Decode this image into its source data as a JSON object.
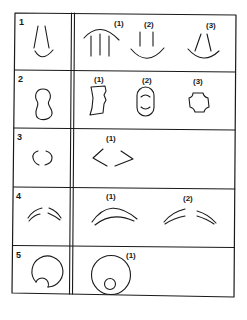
{
  "diagram": {
    "type": "shape-variant-table",
    "colors": {
      "stroke": "#1a1a1a",
      "background": "#ffffff"
    },
    "rows": [
      {
        "number": "1",
        "base_shape": "open-cone-with-bottom-arc",
        "variants": [
          {
            "label": "(1)",
            "shape": "arc-over-three-vertical-lines"
          },
          {
            "label": "(2)",
            "shape": "two-vertical-lines-over-bottom-arc"
          },
          {
            "label": "(3)",
            "shape": "splayed-lines-over-bottom-arc"
          }
        ]
      },
      {
        "number": "2",
        "base_shape": "peanut-outline",
        "variants": [
          {
            "label": "(1)",
            "shape": "irregular-quadrilateral"
          },
          {
            "label": "(2)",
            "shape": "rounded-capsule-with-inner-arcs"
          },
          {
            "label": "(3)",
            "shape": "cross-notched-square"
          }
        ]
      },
      {
        "number": "3",
        "base_shape": "broken-ellipse",
        "variants": [
          {
            "label": "(1)",
            "shape": "broken-diamond"
          }
        ]
      },
      {
        "number": "4",
        "base_shape": "split-double-arc",
        "variants": [
          {
            "label": "(1)",
            "shape": "continuous-double-arc"
          },
          {
            "label": "(2)",
            "shape": "split-double-arc-wide"
          }
        ]
      },
      {
        "number": "5",
        "base_shape": "circle-with-notched-inner-circle",
        "variants": [
          {
            "label": "(1)",
            "shape": "circle-with-small-inner-circle"
          }
        ]
      }
    ]
  }
}
